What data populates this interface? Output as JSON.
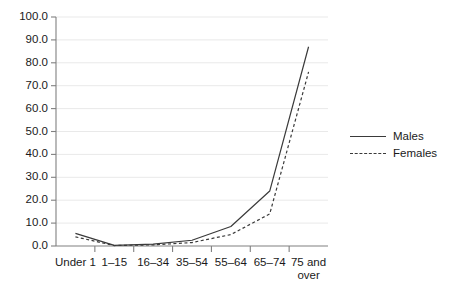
{
  "chart_data": {
    "type": "line",
    "title": "",
    "xlabel": "",
    "ylabel": "",
    "ylim": [
      0.0,
      100.0
    ],
    "ytick_step": 10.0,
    "grid": true,
    "legend_position": "right",
    "categories": [
      "Under 1",
      "1–15",
      "16–34",
      "35–54",
      "55–64",
      "65–74",
      "75 and over"
    ],
    "ytick_labels": [
      "0.0",
      "10.0",
      "20.0",
      "30.0",
      "40.0",
      "50.0",
      "60.0",
      "70.0",
      "80.0",
      "90.0",
      "100.0"
    ],
    "ytick_values": [
      0,
      10,
      20,
      30,
      40,
      50,
      60,
      70,
      80,
      90,
      100
    ],
    "series": [
      {
        "name": "Males",
        "style": "solid",
        "color": "#3a3a3a",
        "values": [
          5.5,
          0.3,
          0.8,
          2.5,
          8.5,
          24.0,
          87.0
        ]
      },
      {
        "name": "Females",
        "style": "dashed",
        "color": "#3a3a3a",
        "values": [
          4.0,
          0.2,
          0.5,
          1.5,
          5.0,
          14.0,
          76.0
        ]
      }
    ]
  },
  "legend": {
    "items": [
      {
        "label": "Males",
        "style": "solid"
      },
      {
        "label": "Females",
        "style": "dashed"
      }
    ]
  },
  "colors": {
    "background": "#ffffff",
    "gridline": "#e9e9e9",
    "axis": "#808080",
    "series": "#3a3a3a",
    "text": "#1a1a1a"
  }
}
